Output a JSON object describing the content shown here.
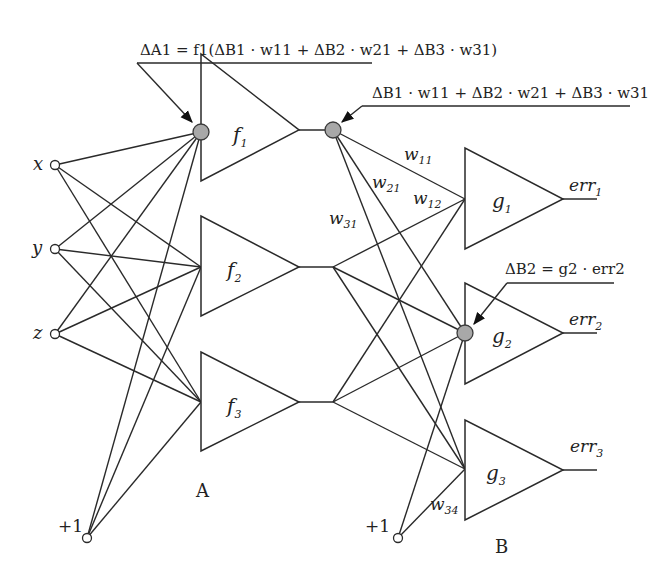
{
  "diagram": {
    "type": "neural-network-backpropagation",
    "inputs": [
      {
        "label": "x"
      },
      {
        "label": "y"
      },
      {
        "label": "z"
      }
    ],
    "bias_A": {
      "label": "+1"
    },
    "bias_B": {
      "label": "+1"
    },
    "layer_A": {
      "label": "A",
      "nodes": [
        {
          "name": "f",
          "sub": "1"
        },
        {
          "name": "f",
          "sub": "2"
        },
        {
          "name": "f",
          "sub": "3"
        }
      ]
    },
    "layer_B": {
      "label": "B",
      "nodes": [
        {
          "name": "g",
          "sub": "1",
          "output": "err",
          "output_sub": "1"
        },
        {
          "name": "g",
          "sub": "2",
          "output": "err",
          "output_sub": "2"
        },
        {
          "name": "g",
          "sub": "3",
          "output": "err",
          "output_sub": "3"
        }
      ]
    },
    "weights": [
      {
        "w": "w",
        "sub": "11"
      },
      {
        "w": "w",
        "sub": "21"
      },
      {
        "w": "w",
        "sub": "12"
      },
      {
        "w": "w",
        "sub": "31"
      },
      {
        "w": "w",
        "sub": "34"
      }
    ],
    "annotations": {
      "delta_A1": "ΔA1 = f1(ΔB1 · w11 + ΔB2 · w21 + ΔB3 · w31)",
      "weighted_sum": "ΔB1 · w11 + ΔB2 · w21 + ΔB3 · w31",
      "delta_B2": "ΔB2 = g2 · err2"
    },
    "colors": {
      "line": "#2a2a2a",
      "highlight_node": "#a8a8a8",
      "background": "#ffffff"
    }
  }
}
